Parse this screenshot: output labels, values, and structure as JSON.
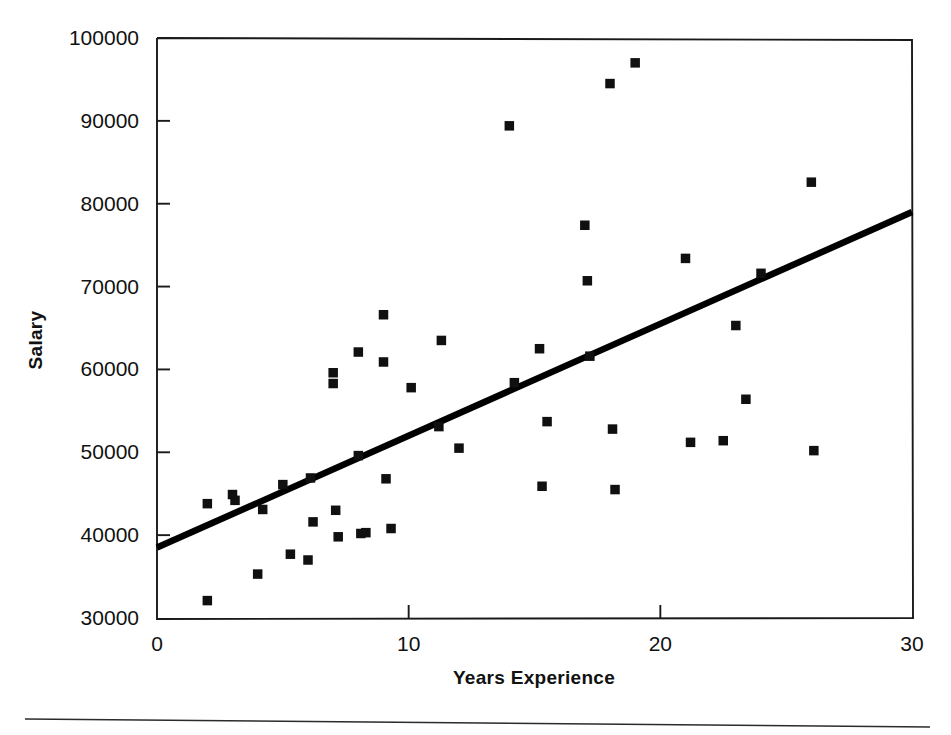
{
  "chart_data": {
    "type": "scatter",
    "title": "",
    "xlabel": "Years Experience",
    "ylabel": "Salary",
    "xlim": [
      0,
      30
    ],
    "ylim": [
      30000,
      100000
    ],
    "grid": false,
    "legend": null,
    "x_ticks": [
      0,
      10,
      20,
      30
    ],
    "y_ticks": [
      30000,
      40000,
      50000,
      60000,
      70000,
      80000,
      90000,
      100000
    ],
    "x_tick_labels": [
      "0",
      "10",
      "20",
      "30"
    ],
    "y_tick_labels": [
      "30000",
      "40000",
      "50000",
      "60000",
      "70000",
      "80000",
      "90000",
      "100000"
    ],
    "marker": "square",
    "marker_color": "#101010",
    "series": [
      {
        "name": "Employees",
        "points": [
          [
            2.0,
            43800
          ],
          [
            2.0,
            32100
          ],
          [
            3.0,
            44900
          ],
          [
            3.1,
            44200
          ],
          [
            4.0,
            35300
          ],
          [
            4.2,
            43100
          ],
          [
            5.0,
            46100
          ],
          [
            5.3,
            37700
          ],
          [
            6.0,
            37000
          ],
          [
            6.1,
            46900
          ],
          [
            6.2,
            41600
          ],
          [
            7.0,
            59600
          ],
          [
            7.0,
            58300
          ],
          [
            7.1,
            43000
          ],
          [
            7.2,
            39800
          ],
          [
            8.0,
            62100
          ],
          [
            8.0,
            49600
          ],
          [
            8.1,
            40200
          ],
          [
            8.3,
            40300
          ],
          [
            9.0,
            66600
          ],
          [
            9.0,
            60900
          ],
          [
            9.1,
            46800
          ],
          [
            9.3,
            40800
          ],
          [
            10.1,
            57800
          ],
          [
            11.2,
            53100
          ],
          [
            11.3,
            63500
          ],
          [
            12.0,
            50500
          ],
          [
            14.0,
            89400
          ],
          [
            14.2,
            58400
          ],
          [
            15.2,
            62500
          ],
          [
            15.3,
            45900
          ],
          [
            15.5,
            53700
          ],
          [
            17.0,
            77400
          ],
          [
            17.1,
            70700
          ],
          [
            17.2,
            61600
          ],
          [
            18.0,
            94500
          ],
          [
            18.1,
            52800
          ],
          [
            18.2,
            45500
          ],
          [
            19.0,
            97000
          ],
          [
            21.0,
            73400
          ],
          [
            21.2,
            51200
          ],
          [
            22.5,
            51400
          ],
          [
            23.0,
            65300
          ],
          [
            23.4,
            56400
          ],
          [
            24.0,
            71600
          ],
          [
            26.0,
            82600
          ],
          [
            26.1,
            50200
          ]
        ]
      }
    ],
    "trendline": {
      "name": "linear-fit",
      "x_start": 0,
      "y_start": 38500,
      "x_end": 30,
      "y_end": 79000
    }
  }
}
